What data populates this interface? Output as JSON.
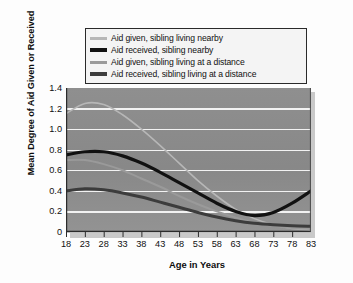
{
  "chart_data": {
    "type": "line",
    "title": "",
    "xlabel": "Age in Years",
    "ylabel": "Mean Degree of Aid Given or Received",
    "xlim": [
      18,
      83
    ],
    "ylim": [
      0,
      1.4
    ],
    "ytick_labels": [
      "1.4",
      "1.2",
      "1.0",
      "0.8",
      "0.6",
      "0.4",
      "0.2",
      "0"
    ],
    "ytick_values": [
      1.4,
      1.2,
      1.0,
      0.8,
      0.6,
      0.4,
      0.2,
      0
    ],
    "xtick_labels": [
      "18",
      "23",
      "28",
      "33",
      "38",
      "43",
      "48",
      "53",
      "58",
      "63",
      "68",
      "73",
      "78",
      "83"
    ],
    "xtick_values": [
      18,
      23,
      28,
      33,
      38,
      43,
      48,
      53,
      58,
      63,
      68,
      73,
      78,
      83
    ],
    "grid": "horizontal-white",
    "legend_position": "above-plot",
    "plot_background": "#8a8a8a",
    "x": [
      18,
      23,
      28,
      33,
      38,
      43,
      48,
      53,
      58,
      63,
      68,
      73,
      78,
      83
    ],
    "series": [
      {
        "name": "Aid given, sibling living nearby",
        "color": "#b7b7b7",
        "width": 1.6,
        "values": [
          1.15,
          1.25,
          1.24,
          1.14,
          1.0,
          0.84,
          0.67,
          0.5,
          0.35,
          0.22,
          0.13,
          0.07,
          0.035,
          0.02
        ]
      },
      {
        "name": "Aid received, sibling nearby",
        "color": "#111111",
        "width": 3.2,
        "values": [
          0.75,
          0.78,
          0.78,
          0.74,
          0.67,
          0.58,
          0.48,
          0.38,
          0.28,
          0.2,
          0.16,
          0.19,
          0.28,
          0.4
        ]
      },
      {
        "name": "Aid given, sibling living at a distance",
        "color": "#9a9a9a",
        "width": 2.0,
        "values": [
          0.7,
          0.7,
          0.66,
          0.6,
          0.52,
          0.44,
          0.35,
          0.27,
          0.2,
          0.14,
          0.09,
          0.06,
          0.04,
          0.03
        ]
      },
      {
        "name": "Aid received, sibling living at a distance",
        "color": "#3c3c3c",
        "width": 3.0,
        "values": [
          0.4,
          0.42,
          0.41,
          0.38,
          0.34,
          0.29,
          0.24,
          0.19,
          0.145,
          0.11,
          0.085,
          0.07,
          0.06,
          0.055
        ]
      }
    ]
  },
  "legend": {
    "items": [
      {
        "label": "Aid given, sibling living nearby"
      },
      {
        "label": "Aid received, sibling nearby"
      },
      {
        "label": "Aid given, sibling living at a distance"
      },
      {
        "label": "Aid received, sibling living at a distance"
      }
    ]
  },
  "axes": {
    "y_title": "Mean Degree of Aid Given or Received",
    "x_title": "Age in Years"
  }
}
